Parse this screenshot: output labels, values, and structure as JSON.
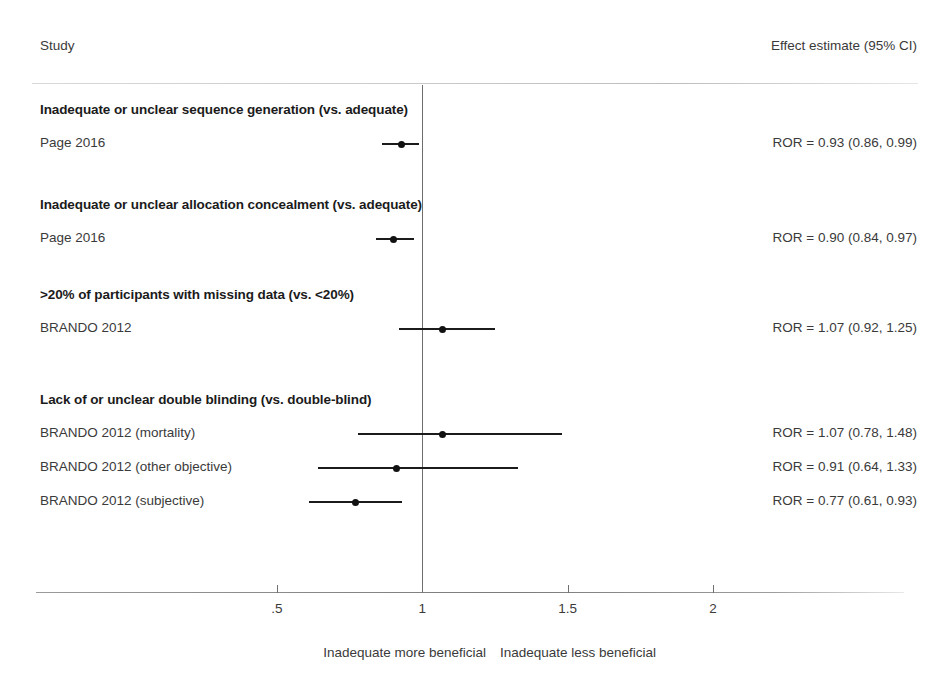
{
  "headers": {
    "study": "Study",
    "effect": "Effect estimate (95% CI)"
  },
  "axis": {
    "ticks": [
      {
        "label": ".5",
        "value": 0.5
      },
      {
        "label": "1",
        "value": 1.0
      },
      {
        "label": "1.5",
        "value": 1.5
      },
      {
        "label": "2",
        "value": 2.0
      }
    ],
    "reference_value": 1.0,
    "left_caption": "Inadequate more beneficial",
    "right_caption": "Inadequate less beneficial"
  },
  "groups": [
    {
      "title": "Inadequate or unclear sequence generation (vs. adequate)",
      "rows": [
        {
          "label": "Page 2016",
          "estimate_text": "ROR = 0.93 (0.86, 0.99)",
          "point": 0.93,
          "lower": 0.86,
          "upper": 0.99
        }
      ]
    },
    {
      "title": "Inadequate or unclear allocation concealment (vs. adequate)",
      "rows": [
        {
          "label": "Page 2016",
          "estimate_text": "ROR = 0.90 (0.84, 0.97)",
          "point": 0.9,
          "lower": 0.84,
          "upper": 0.97
        }
      ]
    },
    {
      "title": ">20% of participants with missing data (vs. <20%)",
      "rows": [
        {
          "label": "BRANDO 2012",
          "estimate_text": "ROR = 1.07 (0.92, 1.25)",
          "point": 1.07,
          "lower": 0.92,
          "upper": 1.25
        }
      ]
    },
    {
      "title": "Lack of or unclear double blinding (vs. double-blind)",
      "rows": [
        {
          "label": "BRANDO 2012 (mortality)",
          "estimate_text": "ROR = 1.07 (0.78, 1.48)",
          "point": 1.07,
          "lower": 0.78,
          "upper": 1.48
        },
        {
          "label": "BRANDO 2012 (other objective)",
          "estimate_text": "ROR = 0.91 (0.64, 1.33)",
          "point": 0.91,
          "lower": 0.64,
          "upper": 1.33
        },
        {
          "label": "BRANDO 2012 (subjective)",
          "estimate_text": "ROR = 0.77 (0.61, 0.93)",
          "point": 0.77,
          "lower": 0.61,
          "upper": 0.93
        }
      ]
    }
  ],
  "chart_data": {
    "type": "scatter",
    "chart_subtype": "forest-plot",
    "title": "",
    "xlabel": "",
    "ylabel": "",
    "xlim": [
      0.28,
      2.2
    ],
    "xscale": "linear",
    "grid": false,
    "legend": "none",
    "reference_line": 1.0,
    "effect_measure": "ROR",
    "xticks": [
      0.5,
      1.0,
      1.5,
      2.0
    ],
    "xticklabels": [
      ".5",
      "1",
      "1.5",
      "2"
    ],
    "categories": [
      "Page 2016",
      "Page 2016",
      "BRANDO 2012",
      "BRANDO 2012 (mortality)",
      "BRANDO 2012 (other objective)",
      "BRANDO 2012 (subjective)"
    ],
    "values": [
      0.93,
      0.9,
      1.07,
      1.07,
      0.91,
      0.77
    ],
    "ci_lower": [
      0.86,
      0.84,
      0.92,
      0.78,
      0.64,
      0.61
    ],
    "ci_upper": [
      0.99,
      0.97,
      1.25,
      1.48,
      1.33,
      0.93
    ],
    "group_labels": [
      "Inadequate or unclear sequence generation (vs. adequate)",
      "Inadequate or unclear allocation concealment (vs. adequate)",
      ">20% of participants with missing data (vs. <20%)",
      "Lack of or unclear double blinding (vs. double-blind)"
    ],
    "annotations": [
      "Inadequate more beneficial",
      "Inadequate less beneficial"
    ]
  }
}
